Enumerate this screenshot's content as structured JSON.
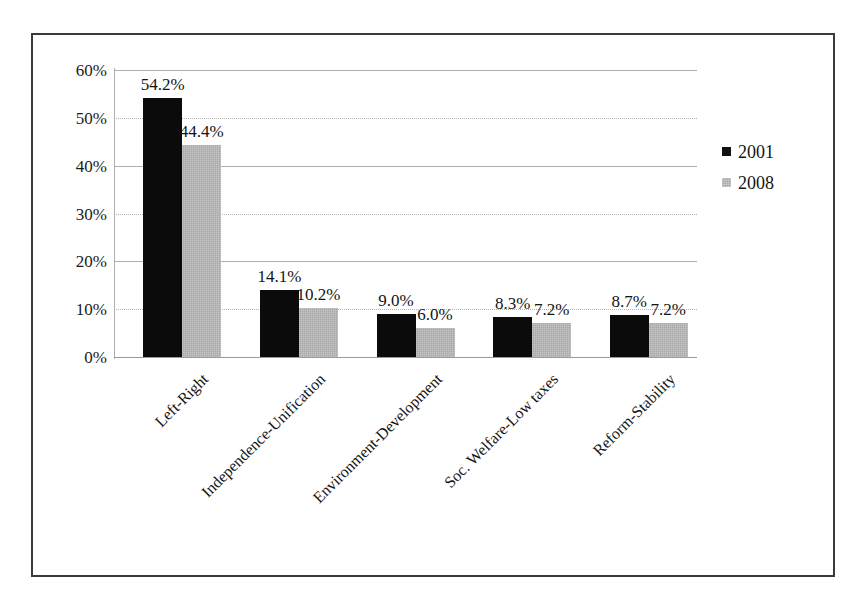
{
  "chart_data": {
    "type": "bar",
    "title": "",
    "xlabel": "",
    "ylabel": "",
    "ylim": [
      0,
      60
    ],
    "grid": true,
    "legend_position": "right",
    "y_ticks": [
      "0%",
      "10%",
      "20%",
      "30%",
      "40%",
      "50%",
      "60%"
    ],
    "y_tick_values": [
      0,
      10,
      20,
      30,
      40,
      50,
      60
    ],
    "categories": [
      "Left-Right",
      "Independence-Unification",
      "Environment-Development",
      "Soc. Welfare-Low taxes",
      "Reform-Stability"
    ],
    "series": [
      {
        "name": "2001",
        "color": "#0b0b0b",
        "values": [
          54.2,
          14.1,
          9.0,
          8.3,
          8.7
        ],
        "labels": [
          "54.2%",
          "14.1%",
          "9.0%",
          "8.3%",
          "8.7%"
        ]
      },
      {
        "name": "2008",
        "color": "#a9a9a9",
        "values": [
          44.4,
          10.2,
          6.0,
          7.2,
          7.2
        ],
        "labels": [
          "44.4%",
          "10.2%",
          "6.0%",
          "7.2%",
          "7.2%"
        ]
      }
    ]
  },
  "legend": {
    "items": [
      {
        "label": "2001",
        "swatch": "black-square-icon"
      },
      {
        "label": "2008",
        "swatch": "gray-square-icon"
      }
    ]
  }
}
